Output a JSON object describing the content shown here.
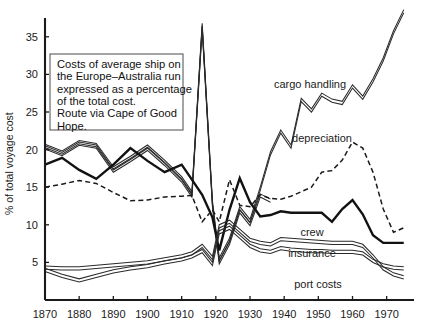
{
  "chart_data": {
    "type": "line",
    "title": "",
    "xlabel": "",
    "ylabel": "% of total voyage cost",
    "xlim": [
      1870,
      1978
    ],
    "ylim": [
      0,
      37.5
    ],
    "xticks": [
      1870,
      1880,
      1890,
      1900,
      1910,
      1920,
      1930,
      1940,
      1950,
      1960,
      1970
    ],
    "yticks": [
      5,
      10,
      15,
      20,
      25,
      30,
      35
    ],
    "grid": false,
    "legend": "inline-annotations",
    "note": {
      "lines": [
        "Costs of average ship on",
        "the Europe–Australia run",
        "expressed as a percentage",
        "of the total cost.",
        "Route via Cape of Good",
        "Hope."
      ]
    },
    "series": [
      {
        "name": "cargo handling",
        "style": "band",
        "label": "cargo handling",
        "x": [
          1870,
          1875,
          1880,
          1885,
          1890,
          1895,
          1900,
          1905,
          1910,
          1913,
          1916,
          1919,
          1921,
          1924,
          1927,
          1930,
          1933,
          1936,
          1939,
          1942,
          1945,
          1948,
          1951,
          1954,
          1957,
          1960,
          1963,
          1966,
          1969,
          1972,
          1975
        ],
        "values": [
          20.5,
          19.6,
          21.0,
          20.6,
          17.5,
          18.9,
          20.4,
          18.4,
          16.2,
          14.2,
          36.6,
          13.0,
          5.4,
          8.0,
          12.2,
          10.5,
          14.8,
          19.5,
          22.4,
          20.4,
          26.6,
          25.2,
          27.3,
          26.5,
          26.2,
          28.4,
          26.9,
          29.2,
          32.0,
          35.6,
          38.4
        ]
      },
      {
        "name": "second-band",
        "style": "band",
        "label": "",
        "x": [
          1870,
          1875,
          1880,
          1885,
          1890,
          1895,
          1900,
          1905,
          1910,
          1913,
          1916,
          1919,
          1921,
          1924,
          1927,
          1930,
          1933,
          1936
        ],
        "values": [
          20.3,
          19.4,
          20.8,
          20.4,
          17.2,
          18.6,
          20.1,
          18.1,
          15.9,
          13.9,
          36.2,
          12.6,
          5.0,
          7.6,
          11.8,
          10.1,
          13.9,
          13.2
        ]
      },
      {
        "name": "crew",
        "style": "thick",
        "label": "crew",
        "x": [
          1870,
          1875,
          1880,
          1885,
          1890,
          1895,
          1900,
          1905,
          1910,
          1913,
          1916,
          1919,
          1921,
          1924,
          1927,
          1930,
          1933,
          1936,
          1939,
          1942,
          1945,
          1948,
          1951,
          1954,
          1957,
          1960,
          1963,
          1966,
          1969,
          1972,
          1975
        ],
        "values": [
          18.0,
          18.9,
          17.3,
          16.1,
          18.0,
          20.2,
          18.5,
          17.0,
          18.0,
          16.0,
          14.0,
          11.0,
          6.6,
          12.0,
          16.2,
          13.0,
          11.1,
          11.3,
          11.8,
          11.6,
          11.6,
          11.6,
          11.6,
          10.4,
          12.1,
          13.3,
          11.4,
          8.6,
          7.6,
          7.6,
          7.6
        ]
      },
      {
        "name": "depreciation",
        "style": "dashed",
        "label": "depreciation",
        "x": [
          1870,
          1875,
          1880,
          1885,
          1890,
          1895,
          1900,
          1905,
          1910,
          1913,
          1916,
          1919,
          1921,
          1924,
          1927,
          1930,
          1933,
          1936,
          1939,
          1942,
          1945,
          1948,
          1951,
          1954,
          1957,
          1960,
          1963,
          1966,
          1969,
          1972,
          1975
        ],
        "values": [
          15.0,
          15.4,
          15.9,
          15.5,
          14.3,
          13.2,
          13.3,
          13.7,
          13.8,
          13.9,
          10.4,
          12.0,
          10.4,
          16.0,
          12.6,
          12.4,
          14.0,
          13.5,
          13.4,
          13.8,
          14.4,
          15.0,
          17.0,
          17.2,
          18.6,
          21.0,
          20.2,
          17.0,
          12.1,
          9.0,
          9.6
        ]
      },
      {
        "name": "insurance",
        "style": "band",
        "label": "insurance",
        "x": [
          1870,
          1875,
          1880,
          1885,
          1890,
          1895,
          1900,
          1905,
          1910,
          1913,
          1916,
          1919,
          1921,
          1924,
          1927,
          1930,
          1933,
          1936,
          1939,
          1942,
          1945,
          1948,
          1951,
          1954,
          1957,
          1960,
          1963,
          1966,
          1969,
          1972,
          1975
        ],
        "values": [
          4.3,
          4.2,
          4.2,
          4.4,
          4.6,
          4.8,
          5.0,
          5.4,
          5.8,
          6.2,
          7.2,
          5.6,
          9.8,
          10.4,
          9.2,
          8.0,
          7.6,
          7.4,
          8.1,
          8.0,
          7.9,
          7.8,
          7.7,
          7.6,
          7.6,
          7.6,
          7.2,
          5.8,
          4.2,
          3.4,
          3.0
        ]
      },
      {
        "name": "port costs",
        "style": "band",
        "label": "port costs",
        "x": [
          1870,
          1875,
          1880,
          1885,
          1890,
          1895,
          1900,
          1905,
          1910,
          1913,
          1916,
          1919,
          1921,
          1924,
          1927,
          1930,
          1933,
          1936,
          1939,
          1942,
          1945,
          1948,
          1951,
          1954,
          1957,
          1960,
          1963,
          1966,
          1969,
          1972,
          1975
        ],
        "values": [
          4.0,
          3.2,
          2.6,
          3.2,
          3.8,
          4.2,
          4.5,
          5.0,
          5.4,
          5.8,
          6.5,
          4.8,
          9.0,
          9.6,
          8.4,
          7.2,
          6.6,
          6.4,
          6.9,
          6.7,
          6.6,
          6.5,
          6.5,
          6.4,
          6.4,
          6.4,
          6.2,
          5.2,
          4.6,
          4.3,
          4.2
        ]
      }
    ],
    "annotations": [
      {
        "name": "cargo-handling-label",
        "text": "cargo handling",
        "x": 310,
        "y": 88
      },
      {
        "name": "depreciation-label",
        "text": "depreciation",
        "x": 322,
        "y": 142
      },
      {
        "name": "crew-label",
        "text": "crew",
        "x": 312,
        "y": 236
      },
      {
        "name": "insurance-label",
        "text": "insurance",
        "x": 312,
        "y": 257
      },
      {
        "name": "port-costs-label",
        "text": "port costs",
        "x": 318,
        "y": 288
      }
    ]
  }
}
